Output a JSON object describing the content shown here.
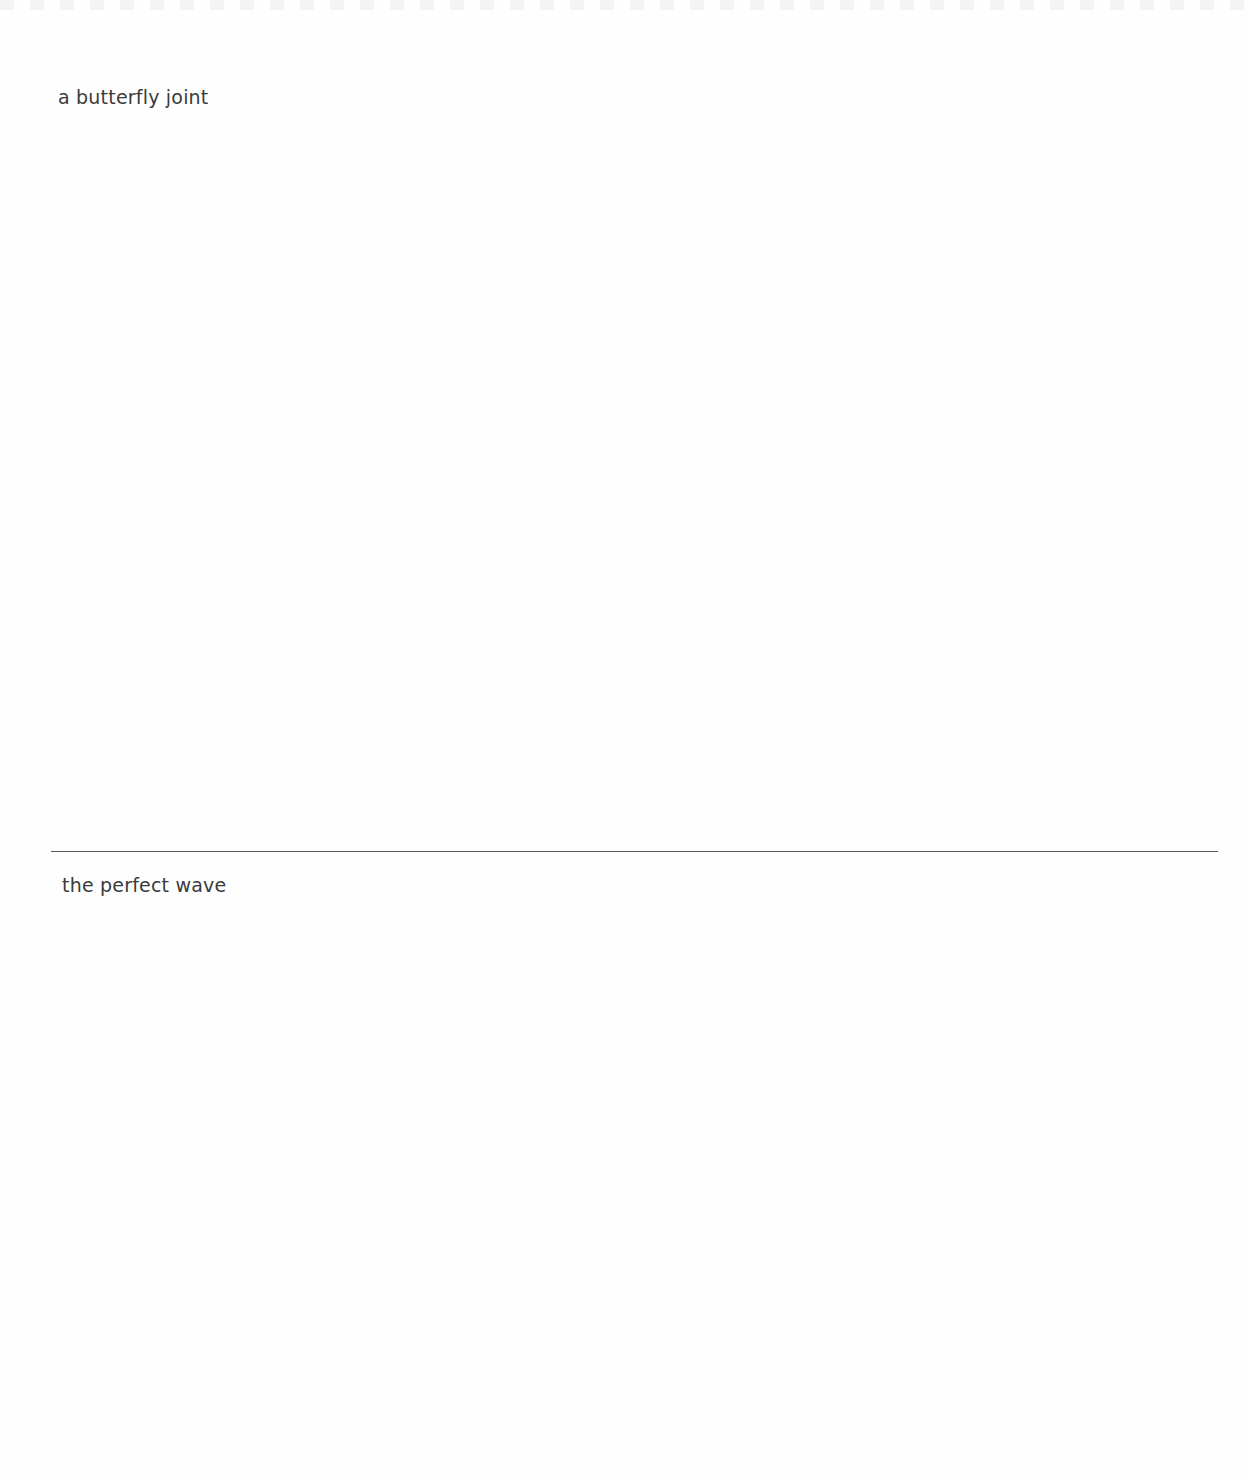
{
  "sections": [
    {
      "caption": "a butterfly joint"
    },
    {
      "caption": "the perfect wave"
    }
  ],
  "colors": {
    "background": "#fefefe",
    "text": "#3b3b3b",
    "divider": "#555555"
  }
}
